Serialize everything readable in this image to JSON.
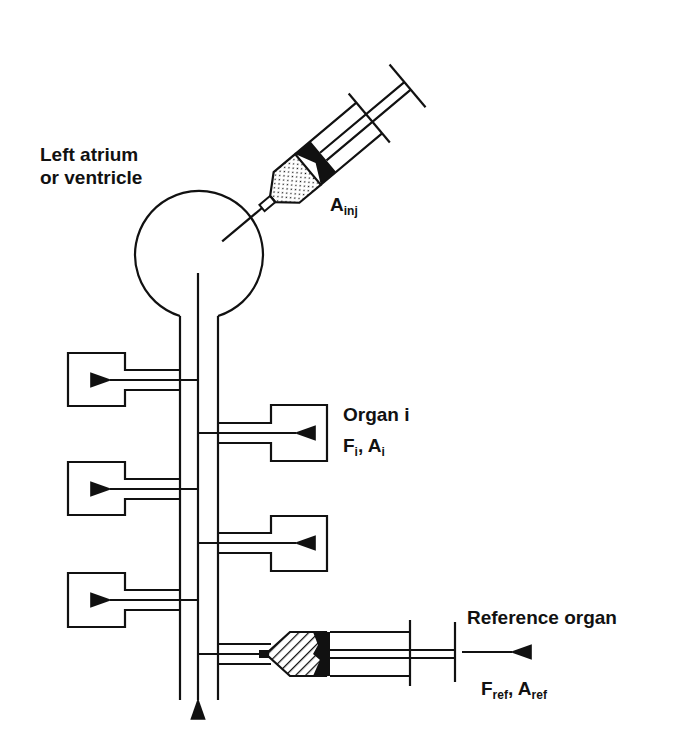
{
  "diagram": {
    "type": "microsphere-reference-organ-method",
    "colors": {
      "ink": "#111111",
      "background": "#ffffff"
    },
    "labels": {
      "chamber_line1": "Left atrium",
      "chamber_line2": "or ventricle",
      "injection": {
        "main": "A",
        "sub": "inj"
      },
      "organ_i": "Organ i",
      "organ_i_vars": {
        "f": "F",
        "f_sub": "i",
        "a": "A",
        "a_sub": "i",
        "sep": ", "
      },
      "reference_organ": "Reference organ",
      "reference_vars": {
        "f": "F",
        "f_sub": "ref",
        "a": "A",
        "a_sub": "ref",
        "sep": ", "
      }
    },
    "components": [
      {
        "name": "injection-syringe",
        "role": "injects microspheres into chamber"
      },
      {
        "name": "heart-chamber",
        "role": "left atrium or ventricle"
      },
      {
        "name": "aorta-vessel",
        "role": "main arterial trunk"
      },
      {
        "name": "organ-left-1"
      },
      {
        "name": "organ-left-2"
      },
      {
        "name": "organ-left-3"
      },
      {
        "name": "organ-right-i",
        "label": "Organ i"
      },
      {
        "name": "organ-right-2"
      },
      {
        "name": "withdrawal-syringe",
        "role": "reference organ sampling"
      }
    ]
  }
}
